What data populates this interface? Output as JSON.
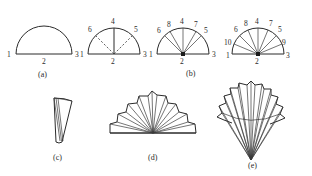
{
  "figure": {
    "panels": [
      {
        "id": "a",
        "caption": "(a)",
        "description": "semicircle with base endpoints and midpoint labelled",
        "labels": [
          "1",
          "2",
          "3"
        ]
      },
      {
        "id": "a2",
        "caption": "",
        "description": "semicircle subdivided by one solid radius and two dashed radii",
        "labels": [
          "1",
          "2",
          "3",
          "4",
          "5",
          "6"
        ]
      },
      {
        "id": "b1",
        "caption": "",
        "description": "semicircle subdivided into six sectors",
        "labels": [
          "1",
          "2",
          "3",
          "4",
          "5",
          "6",
          "7",
          "8"
        ]
      },
      {
        "id": "b",
        "caption": "(b)",
        "description": "semicircle subdivided into eight sectors",
        "labels": [
          "1",
          "2",
          "3",
          "4",
          "5",
          "6",
          "7",
          "8",
          "9",
          "10"
        ]
      },
      {
        "id": "c",
        "caption": "(c)",
        "description": "narrow inverted wedge with hatched edge",
        "labels": []
      },
      {
        "id": "d",
        "caption": "(d)",
        "description": "wide fan with many radial folds and scalloped rim",
        "labels": []
      },
      {
        "id": "e",
        "caption": "(e)",
        "description": "tall fan with arc crossing and scalloped rim",
        "labels": []
      }
    ],
    "colors": {
      "stroke": "#2b2b2b",
      "background": "#ffffff"
    }
  }
}
